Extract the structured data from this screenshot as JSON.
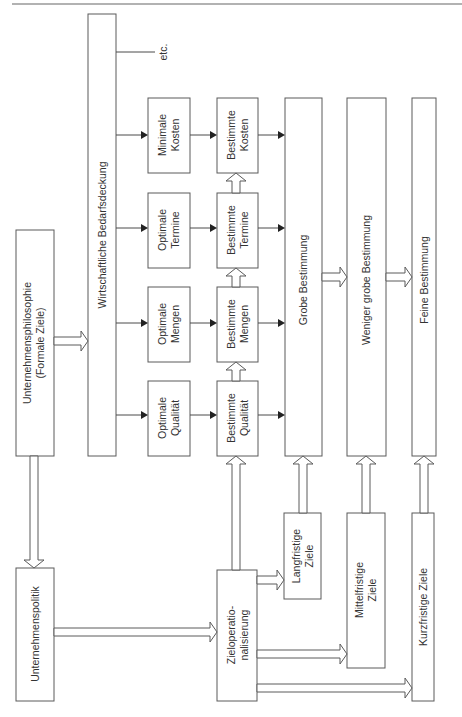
{
  "diagram": {
    "title": "",
    "orientation": "rotated-90-ccw",
    "nodes": {
      "philosophie": {
        "line1": "Unternehmensphilosophie",
        "line2": "(Formale Ziele)"
      },
      "bedarfsdeckung": {
        "label": "Wirtschaftliche Bedarfsdeckung"
      },
      "etc": {
        "label": "etc."
      },
      "optimale_kosten": {
        "line1": "Minimale",
        "line2": "Kosten"
      },
      "optimale_termine": {
        "line1": "Optimale",
        "line2": "Termine"
      },
      "optimale_mengen": {
        "line1": "Optimale",
        "line2": "Mengen"
      },
      "optimale_qualitaet": {
        "line1": "Optimale",
        "line2": "Qualität"
      },
      "bestimmte_kosten": {
        "line1": "Bestimmte",
        "line2": "Kosten"
      },
      "bestimmte_termine": {
        "line1": "Bestimmte",
        "line2": "Termine"
      },
      "bestimmte_mengen": {
        "line1": "Bestimmte",
        "line2": "Mengen"
      },
      "bestimmte_qualitaet": {
        "line1": "Bestimmte",
        "line2": "Qualität"
      },
      "grobe": {
        "label": "Grobe Bestimmung"
      },
      "weniger_grobe": {
        "label": "Weniger grobe Bestimmung"
      },
      "feine": {
        "label": "Feine Bestimmung"
      },
      "politik": {
        "label": "Unternehmenspolitik"
      },
      "zielop": {
        "line1": "Zieloperatio-",
        "line2": "nalisierung"
      },
      "langfristig": {
        "line1": "Langfristige",
        "line2": "Ziele"
      },
      "mittelfristig": {
        "line1": "Mittelfristige",
        "line2": "Ziele"
      },
      "kurzfristig": {
        "label": "Kurzfristige Ziele"
      }
    },
    "edges": [
      {
        "from": "philosophie",
        "to": "bedarfsdeckung",
        "style": "hollow"
      },
      {
        "from": "philosophie",
        "to": "politik",
        "style": "hollow"
      },
      {
        "from": "bedarfsdeckung",
        "to": "optimale_kosten",
        "style": "solid"
      },
      {
        "from": "bedarfsdeckung",
        "to": "optimale_termine",
        "style": "solid"
      },
      {
        "from": "bedarfsdeckung",
        "to": "optimale_mengen",
        "style": "solid"
      },
      {
        "from": "bedarfsdeckung",
        "to": "optimale_qualitaet",
        "style": "solid"
      },
      {
        "from": "bedarfsdeckung",
        "to": "etc",
        "style": "line"
      },
      {
        "from": "optimale_kosten",
        "to": "bestimmte_kosten",
        "style": "solid"
      },
      {
        "from": "optimale_termine",
        "to": "bestimmte_termine",
        "style": "solid"
      },
      {
        "from": "optimale_mengen",
        "to": "bestimmte_mengen",
        "style": "solid"
      },
      {
        "from": "optimale_qualitaet",
        "to": "bestimmte_qualitaet",
        "style": "solid"
      },
      {
        "from": "bestimmte_qualitaet",
        "to": "bestimmte_mengen",
        "style": "hollow"
      },
      {
        "from": "bestimmte_mengen",
        "to": "bestimmte_termine",
        "style": "hollow"
      },
      {
        "from": "bestimmte_termine",
        "to": "bestimmte_kosten",
        "style": "hollow"
      },
      {
        "from": "bestimmte_kosten",
        "to": "grobe",
        "style": "solid"
      },
      {
        "from": "bestimmte_termine",
        "to": "grobe",
        "style": "solid"
      },
      {
        "from": "bestimmte_mengen",
        "to": "grobe",
        "style": "solid"
      },
      {
        "from": "bestimmte_qualitaet",
        "to": "grobe",
        "style": "solid"
      },
      {
        "from": "grobe",
        "to": "weniger_grobe",
        "style": "hollow"
      },
      {
        "from": "weniger_grobe",
        "to": "feine",
        "style": "hollow"
      },
      {
        "from": "politik",
        "to": "zielop",
        "style": "hollow"
      },
      {
        "from": "zielop",
        "to": "bestimmte_qualitaet",
        "style": "hollow"
      },
      {
        "from": "zielop",
        "to": "langfristig",
        "style": "hollow"
      },
      {
        "from": "zielop",
        "to": "mittelfristig",
        "style": "hollow"
      },
      {
        "from": "zielop",
        "to": "kurzfristig",
        "style": "hollow"
      },
      {
        "from": "langfristig",
        "to": "grobe",
        "style": "hollow"
      },
      {
        "from": "mittelfristig",
        "to": "weniger_grobe",
        "style": "hollow"
      },
      {
        "from": "kurzfristig",
        "to": "feine",
        "style": "hollow"
      }
    ]
  }
}
